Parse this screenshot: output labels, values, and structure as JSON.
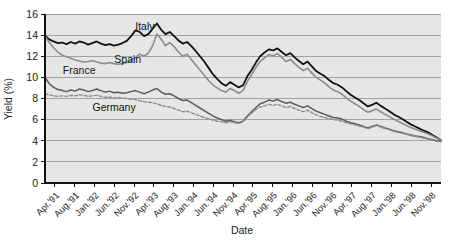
{
  "chart_data": {
    "type": "line",
    "title": "",
    "xlabel": "Date",
    "ylabel": "Yield (%)",
    "ylim": [
      0,
      16
    ],
    "yticks": [
      0,
      2,
      4,
      6,
      8,
      10,
      12,
      14,
      16
    ],
    "grid": true,
    "legend_position": "inline-annotations",
    "background_color": "#e6e6e6",
    "x_tick_labels": [
      "Apr.'91",
      "Aug.'91",
      "Jan.'92",
      "Jun.'92",
      "Nov.'92",
      "Apr.'93",
      "Aug.'93",
      "Jan.'94",
      "Jun.'94",
      "Nov.'94",
      "Apr.'95",
      "Aug.'95",
      "Jan.'96",
      "Jun.'96",
      "Nov.'96",
      "Apr.'97",
      "Aug.'97",
      "Jan.'98",
      "Jun.'98",
      "Nov.'98"
    ],
    "x_start": "Apr.'91",
    "x_end": "Dec.'98",
    "n_points": 93,
    "annotations": [
      {
        "text": "Italy",
        "x_frac": 0.228,
        "y_value": 14.45
      },
      {
        "text": "Spain",
        "x_frac": 0.175,
        "y_value": 11.35
      },
      {
        "text": "France",
        "x_frac": 0.045,
        "y_value": 10.35
      },
      {
        "text": "Germany",
        "x_frac": 0.12,
        "y_value": 6.85
      }
    ],
    "series": [
      {
        "name": "Italy",
        "color": "#111111",
        "width": 1.8,
        "dash": "none",
        "values": [
          13.95,
          13.6,
          13.4,
          13.25,
          13.3,
          13.15,
          13.35,
          13.2,
          13.4,
          13.3,
          13.1,
          13.25,
          13.4,
          13.2,
          13.05,
          13.15,
          13.0,
          13.1,
          13.25,
          13.45,
          13.9,
          14.45,
          14.3,
          13.9,
          14.1,
          14.6,
          15.1,
          14.5,
          14.1,
          14.3,
          13.9,
          13.5,
          13.2,
          13.35,
          12.95,
          12.5,
          12.0,
          11.5,
          10.9,
          10.3,
          9.85,
          9.45,
          9.2,
          9.55,
          9.3,
          9.05,
          9.25,
          10.1,
          10.7,
          11.4,
          12.0,
          12.35,
          12.65,
          12.55,
          12.75,
          12.4,
          12.1,
          12.3,
          11.9,
          11.55,
          11.25,
          11.5,
          11.05,
          10.6,
          10.35,
          10.1,
          9.75,
          9.45,
          9.3,
          9.05,
          8.7,
          8.35,
          8.1,
          7.85,
          7.55,
          7.25,
          7.4,
          7.6,
          7.3,
          7.05,
          6.8,
          6.5,
          6.3,
          6.05,
          5.8,
          5.55,
          5.35,
          5.15,
          4.95,
          4.8,
          4.55,
          4.3,
          4.05
        ]
      },
      {
        "name": "Spain",
        "color": "#8c8c8c",
        "width": 1.6,
        "dash": "none",
        "values": [
          13.9,
          13.3,
          12.8,
          12.4,
          12.1,
          11.95,
          11.8,
          11.65,
          11.55,
          11.45,
          11.5,
          11.6,
          11.45,
          11.35,
          11.3,
          11.4,
          11.3,
          11.25,
          11.3,
          11.4,
          11.6,
          11.9,
          12.2,
          12.0,
          12.3,
          13.0,
          14.1,
          13.6,
          13.0,
          13.3,
          12.9,
          12.4,
          12.0,
          12.2,
          11.7,
          11.2,
          10.7,
          10.2,
          9.7,
          9.3,
          9.0,
          8.75,
          8.6,
          8.95,
          8.75,
          8.5,
          8.75,
          9.6,
          10.25,
          10.95,
          11.5,
          11.85,
          12.15,
          12.05,
          12.25,
          11.9,
          11.5,
          11.7,
          11.3,
          10.95,
          10.65,
          10.85,
          10.4,
          10.0,
          9.75,
          9.45,
          9.1,
          8.8,
          8.65,
          8.4,
          8.05,
          7.75,
          7.5,
          7.25,
          6.95,
          6.7,
          6.85,
          7.0,
          6.75,
          6.5,
          6.3,
          6.05,
          5.85,
          5.65,
          5.45,
          5.25,
          5.1,
          4.95,
          4.8,
          4.65,
          4.45,
          4.25,
          4.05
        ]
      },
      {
        "name": "France",
        "color": "#5a5a5a",
        "width": 1.5,
        "dash": "none",
        "values": [
          10.0,
          9.4,
          9.05,
          8.85,
          8.75,
          8.65,
          8.8,
          8.7,
          8.9,
          8.8,
          8.65,
          8.75,
          8.9,
          8.75,
          8.6,
          8.7,
          8.55,
          8.6,
          8.5,
          8.55,
          8.65,
          8.75,
          8.6,
          8.45,
          8.6,
          8.8,
          8.95,
          8.6,
          8.4,
          8.45,
          8.25,
          8.0,
          7.8,
          7.85,
          7.6,
          7.35,
          7.1,
          6.85,
          6.6,
          6.35,
          6.15,
          6.0,
          5.85,
          5.95,
          5.8,
          5.7,
          5.85,
          6.35,
          6.75,
          7.15,
          7.5,
          7.65,
          7.85,
          7.75,
          7.9,
          7.7,
          7.55,
          7.65,
          7.45,
          7.3,
          7.15,
          7.3,
          7.05,
          6.8,
          6.65,
          6.5,
          6.35,
          6.2,
          6.15,
          6.05,
          5.85,
          5.7,
          5.6,
          5.5,
          5.35,
          5.2,
          5.35,
          5.5,
          5.35,
          5.2,
          5.1,
          4.95,
          4.85,
          4.75,
          4.65,
          4.55,
          4.45,
          4.4,
          4.3,
          4.2,
          4.1,
          4.0,
          3.95
        ]
      },
      {
        "name": "Germany",
        "color": "#8c8c8c",
        "width": 1.4,
        "dash": "3,2",
        "values": [
          8.45,
          8.35,
          8.25,
          8.2,
          8.25,
          8.2,
          8.3,
          8.25,
          8.35,
          8.3,
          8.2,
          8.25,
          8.3,
          8.2,
          8.1,
          8.15,
          8.05,
          8.1,
          8.05,
          8.0,
          7.95,
          7.9,
          7.8,
          7.7,
          7.65,
          7.6,
          7.5,
          7.35,
          7.25,
          7.2,
          7.05,
          6.9,
          6.75,
          6.8,
          6.65,
          6.5,
          6.35,
          6.2,
          6.1,
          5.95,
          5.85,
          5.8,
          5.7,
          5.8,
          5.7,
          5.65,
          5.8,
          6.25,
          6.6,
          6.95,
          7.2,
          7.3,
          7.45,
          7.35,
          7.45,
          7.3,
          7.15,
          7.25,
          7.05,
          6.9,
          6.75,
          6.9,
          6.65,
          6.45,
          6.3,
          6.2,
          6.1,
          6.0,
          5.95,
          5.85,
          5.7,
          5.6,
          5.5,
          5.4,
          5.3,
          5.15,
          5.3,
          5.45,
          5.3,
          5.15,
          5.05,
          4.9,
          4.8,
          4.7,
          4.6,
          4.5,
          4.4,
          4.35,
          4.25,
          4.15,
          4.05,
          3.95,
          3.9
        ]
      }
    ]
  }
}
